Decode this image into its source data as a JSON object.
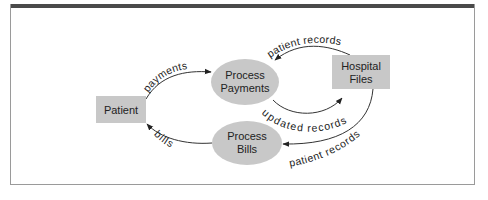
{
  "diagram": {
    "type": "data-flow",
    "colors": {
      "shape_fill": "#c8c8c8",
      "line": "#333333",
      "frame": "#9a9a9a",
      "top_bar": "#4a4a4a"
    },
    "nodes": {
      "patient": {
        "label": "Patient",
        "shape": "rectangle"
      },
      "process_payments": {
        "line1": "Process",
        "line2": "Payments",
        "shape": "ellipse"
      },
      "hospital_files": {
        "line1": "Hospital",
        "line2": "Files",
        "shape": "rectangle"
      },
      "process_bills": {
        "line1": "Process",
        "line2": "Bills",
        "shape": "ellipse"
      }
    },
    "flows": {
      "payments": {
        "label": "payments",
        "from": "Patient",
        "to": "Process Payments"
      },
      "patient_records_top": {
        "label": "patient records",
        "from": "Hospital Files",
        "to": "Process Payments"
      },
      "updated_records": {
        "label": "updated records",
        "from": "Process Payments",
        "to": "Hospital Files"
      },
      "patient_records_bottom": {
        "label": "patient records",
        "from": "Hospital Files",
        "to": "Process Bills"
      },
      "bills": {
        "label": "bills",
        "from": "Process Bills",
        "to": "Patient"
      }
    }
  }
}
